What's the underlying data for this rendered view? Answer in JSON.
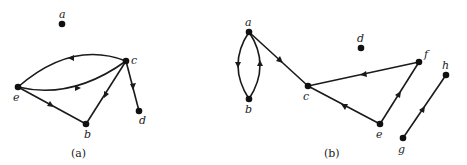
{
  "colors": {
    "stroke": "#1a1a1a",
    "node": "#111111",
    "text": "#222222",
    "background": "#ffffff"
  },
  "graphs": [
    {
      "caption": "(a)",
      "nodes": [
        {
          "id": "a",
          "label": "a",
          "x": 62,
          "y": 24
        },
        {
          "id": "b",
          "label": "b",
          "x": 86,
          "y": 124
        },
        {
          "id": "c",
          "label": "c",
          "x": 126,
          "y": 61
        },
        {
          "id": "d",
          "label": "d",
          "x": 139,
          "y": 111
        },
        {
          "id": "e",
          "label": "e",
          "x": 18,
          "y": 87
        }
      ],
      "edges": [
        {
          "from": "c",
          "to": "e",
          "shape": "upper-arc"
        },
        {
          "from": "e",
          "to": "c",
          "shape": "lower-arc"
        },
        {
          "from": "e",
          "to": "b",
          "shape": "straight"
        },
        {
          "from": "c",
          "to": "b",
          "shape": "straight"
        },
        {
          "from": "c",
          "to": "d",
          "shape": "straight"
        }
      ]
    },
    {
      "caption": "(b)",
      "nodes": [
        {
          "id": "a",
          "label": "a",
          "x": 249,
          "y": 32
        },
        {
          "id": "b",
          "label": "b",
          "x": 249,
          "y": 99
        },
        {
          "id": "c",
          "label": "c",
          "x": 308,
          "y": 86
        },
        {
          "id": "d",
          "label": "d",
          "x": 361,
          "y": 48
        },
        {
          "id": "e",
          "label": "e",
          "x": 380,
          "y": 124
        },
        {
          "id": "f",
          "label": "f",
          "x": 419,
          "y": 62
        },
        {
          "id": "g",
          "label": "g",
          "x": 403,
          "y": 138
        },
        {
          "id": "h",
          "label": "h",
          "x": 446,
          "y": 75
        }
      ],
      "edges": [
        {
          "from": "a",
          "to": "b",
          "shape": "left-arc"
        },
        {
          "from": "b",
          "to": "a",
          "shape": "right-arc"
        },
        {
          "from": "a",
          "to": "c",
          "shape": "straight"
        },
        {
          "from": "f",
          "to": "c",
          "shape": "straight"
        },
        {
          "from": "e",
          "to": "c",
          "shape": "straight"
        },
        {
          "from": "e",
          "to": "f",
          "shape": "straight"
        },
        {
          "from": "g",
          "to": "h",
          "shape": "straight"
        }
      ]
    }
  ]
}
